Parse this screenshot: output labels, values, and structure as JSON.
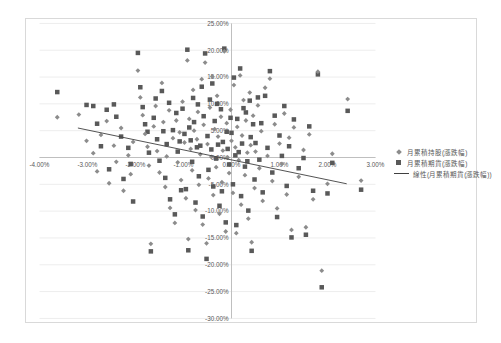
{
  "window": {
    "background": "#ffffff",
    "frame_border": "#d9d9d9"
  },
  "colors": {
    "gridline": "#ededed",
    "axis_line": "#bfbfbf",
    "tick_text": "#595959",
    "series1_marker": "#8c8c8c",
    "series2_marker": "#595959",
    "trendline": "#404040"
  },
  "chart_data": {
    "type": "scatter",
    "title": "",
    "xlabel": "",
    "ylabel": "",
    "grid": "horizontal-only",
    "legend_position": "right-middle",
    "x_axis": {
      "min": -4,
      "max": 3,
      "step": 1,
      "tick_values": [
        -4,
        -3,
        -2,
        -1,
        0,
        1,
        2,
        3
      ],
      "tick_labels": [
        "-4.00%",
        "-3.00%",
        "-2.00%",
        "-1.00%",
        "0.00%",
        "1.00%",
        "2.00%",
        "3.00%"
      ]
    },
    "y_axis": {
      "min": -30,
      "max": 25,
      "step": 5,
      "tick_values": [
        25,
        20,
        15,
        10,
        5,
        0,
        -5,
        -10,
        -15,
        -20,
        -25,
        -30
      ],
      "tick_labels": [
        "25.00%",
        "20.00%",
        "15.00%",
        "10.00%",
        "5.00%",
        "0.00%",
        "-5.00%",
        "-10.00%",
        "-15.00%",
        "-20.00%",
        "-25.00%",
        "-30.00%"
      ]
    },
    "series": [
      {
        "name": "月累積持股(漲跌幅)",
        "marker": "diamond",
        "color": "#8c8c8c",
        "points": [
          [
            -3.63,
            7.5
          ],
          [
            -3.18,
            8.0
          ],
          [
            -3.02,
            3.1
          ],
          [
            -2.88,
            0.8
          ],
          [
            -2.8,
            -2.6
          ],
          [
            -2.72,
            4.2
          ],
          [
            -2.6,
            6.8
          ],
          [
            -2.55,
            -4.8
          ],
          [
            -2.45,
            2.2
          ],
          [
            -2.4,
            -0.8
          ],
          [
            -2.3,
            5.5
          ],
          [
            -2.25,
            -6.2
          ],
          [
            -2.15,
            0.4
          ],
          [
            -2.1,
            -3.1
          ],
          [
            -2.05,
            2.9
          ],
          [
            -1.95,
            16.2
          ],
          [
            -1.9,
            11.2
          ],
          [
            -1.85,
            7.9
          ],
          [
            -1.8,
            4.4
          ],
          [
            -1.75,
            2.0
          ],
          [
            -1.72,
            -1.5
          ],
          [
            -1.68,
            -16.1
          ],
          [
            -1.62,
            5.8
          ],
          [
            -1.58,
            9.6
          ],
          [
            -1.55,
            1.2
          ],
          [
            -1.5,
            -2.8
          ],
          [
            -1.45,
            13.9
          ],
          [
            -1.42,
            6.6
          ],
          [
            -1.38,
            -5.5
          ],
          [
            -1.35,
            0.2
          ],
          [
            -1.3,
            8.8
          ],
          [
            -1.28,
            -9.4
          ],
          [
            -1.22,
            3.6
          ],
          [
            -1.18,
            -12.2
          ],
          [
            -1.15,
            6.9
          ],
          [
            -1.12,
            -0.9
          ],
          [
            -1.08,
            4.7
          ],
          [
            -1.05,
            -4.2
          ],
          [
            -1.02,
            10.4
          ],
          [
            -0.98,
            2.8
          ],
          [
            -0.95,
            -7.6
          ],
          [
            -0.92,
            18.1
          ],
          [
            -0.9,
            -15.2
          ],
          [
            -0.88,
            7.2
          ],
          [
            -0.85,
            1.6
          ],
          [
            -0.82,
            -2.4
          ],
          [
            -0.8,
            12.6
          ],
          [
            -0.78,
            5.0
          ],
          [
            -0.75,
            -9.8
          ],
          [
            -0.72,
            3.4
          ],
          [
            -0.7,
            8.5
          ],
          [
            -0.68,
            -5.1
          ],
          [
            -0.65,
            0.6
          ],
          [
            -0.62,
            14.6
          ],
          [
            -0.6,
            -12.5
          ],
          [
            -0.58,
            6.1
          ],
          [
            -0.55,
            17.7
          ],
          [
            -0.52,
            -16.0
          ],
          [
            -0.5,
            2.5
          ],
          [
            -0.48,
            -3.9
          ],
          [
            -0.45,
            9.3
          ],
          [
            -0.42,
            0.1
          ],
          [
            -0.4,
            15.1
          ],
          [
            -0.38,
            -7.0
          ],
          [
            -0.35,
            5.3
          ],
          [
            -0.32,
            -1.8
          ],
          [
            -0.3,
            11.5
          ],
          [
            -0.28,
            3.9
          ],
          [
            -0.25,
            -10.5
          ],
          [
            -0.22,
            7.6
          ],
          [
            -0.2,
            -4.6
          ],
          [
            -0.18,
            1.3
          ],
          [
            -0.15,
            19.8
          ],
          [
            -0.12,
            -13.8
          ],
          [
            -0.1,
            6.4
          ],
          [
            -0.08,
            0.0
          ],
          [
            -0.05,
            -2.9
          ],
          [
            -0.02,
            8.9
          ],
          [
            0.0,
            3.1
          ],
          [
            0.03,
            -6.6
          ],
          [
            0.05,
            13.5
          ],
          [
            0.08,
            1.9
          ],
          [
            0.1,
            -14.1
          ],
          [
            0.12,
            5.7
          ],
          [
            0.15,
            -0.5
          ],
          [
            0.18,
            15.3
          ],
          [
            0.2,
            -8.8
          ],
          [
            0.22,
            4.1
          ],
          [
            0.25,
            10.7
          ],
          [
            0.28,
            -3.3
          ],
          [
            0.3,
            6.9
          ],
          [
            0.33,
            0.9
          ],
          [
            0.35,
            -11.4
          ],
          [
            0.38,
            12.1
          ],
          [
            0.4,
            2.3
          ],
          [
            0.42,
            -15.8
          ],
          [
            0.45,
            7.8
          ],
          [
            0.48,
            -5.7
          ],
          [
            0.5,
            1.1
          ],
          [
            0.55,
            9.7
          ],
          [
            0.58,
            -2.0
          ],
          [
            0.62,
            4.9
          ],
          [
            0.65,
            -8.1
          ],
          [
            0.7,
            13.0
          ],
          [
            0.75,
            0.3
          ],
          [
            0.8,
            14.7
          ],
          [
            0.85,
            -4.4
          ],
          [
            0.9,
            6.2
          ],
          [
            0.95,
            -9.5
          ],
          [
            1.0,
            2.6
          ],
          [
            1.05,
            -1.2
          ],
          [
            1.1,
            8.2
          ],
          [
            1.15,
            -6.9
          ],
          [
            1.2,
            3.7
          ],
          [
            1.25,
            -13.5
          ],
          [
            1.3,
            5.6
          ],
          [
            1.4,
            -3.6
          ],
          [
            1.5,
            1.4
          ],
          [
            1.55,
            -13.0
          ],
          [
            1.62,
            4.3
          ],
          [
            1.7,
            -7.8
          ],
          [
            1.8,
            16.0
          ],
          [
            1.88,
            -21.1
          ],
          [
            2.0,
            -4.9
          ],
          [
            2.1,
            0.7
          ],
          [
            2.42,
            10.9
          ],
          [
            2.7,
            -4.3
          ]
        ]
      },
      {
        "name": "月累積期貨(漲跌幅)",
        "marker": "square",
        "color": "#595959",
        "points": [
          [
            -3.63,
            12.2
          ],
          [
            -3.02,
            9.8
          ],
          [
            -2.88,
            9.6
          ],
          [
            -2.8,
            6.3
          ],
          [
            -2.72,
            2.1
          ],
          [
            -2.6,
            8.9
          ],
          [
            -2.55,
            -2.2
          ],
          [
            -2.45,
            9.9
          ],
          [
            -2.4,
            7.6
          ],
          [
            -2.3,
            3.9
          ],
          [
            -2.25,
            -4.0
          ],
          [
            -2.15,
            1.8
          ],
          [
            -2.1,
            -1.2
          ],
          [
            -2.05,
            -8.2
          ],
          [
            -1.95,
            19.5
          ],
          [
            -1.9,
            13.1
          ],
          [
            -1.85,
            9.4
          ],
          [
            -1.8,
            6.2
          ],
          [
            -1.75,
            4.8
          ],
          [
            -1.72,
            0.9
          ],
          [
            -1.68,
            -17.5
          ],
          [
            -1.62,
            7.4
          ],
          [
            -1.58,
            11.0
          ],
          [
            -1.55,
            3.4
          ],
          [
            -1.5,
            -0.6
          ],
          [
            -1.45,
            12.4
          ],
          [
            -1.42,
            4.9
          ],
          [
            -1.38,
            -3.8
          ],
          [
            -1.35,
            2.5
          ],
          [
            -1.3,
            10.2
          ],
          [
            -1.28,
            -7.8
          ],
          [
            -1.22,
            5.1
          ],
          [
            -1.18,
            -10.6
          ],
          [
            -1.15,
            8.3
          ],
          [
            -1.12,
            1.1
          ],
          [
            -1.08,
            3.0
          ],
          [
            -1.05,
            -6.1
          ],
          [
            -1.02,
            9.1
          ],
          [
            -0.98,
            4.4
          ],
          [
            -0.95,
            -5.9
          ],
          [
            -0.92,
            20.1
          ],
          [
            -0.9,
            -17.3
          ],
          [
            -0.88,
            5.6
          ],
          [
            -0.85,
            3.2
          ],
          [
            -0.82,
            -0.8
          ],
          [
            -0.8,
            11.1
          ],
          [
            -0.78,
            6.6
          ],
          [
            -0.75,
            -8.4
          ],
          [
            -0.72,
            1.9
          ],
          [
            -0.7,
            9.9
          ],
          [
            -0.68,
            -3.5
          ],
          [
            -0.65,
            2.2
          ],
          [
            -0.62,
            13.2
          ],
          [
            -0.6,
            -11.0
          ],
          [
            -0.58,
            7.7
          ],
          [
            -0.55,
            19.4
          ],
          [
            -0.52,
            -18.9
          ],
          [
            -0.5,
            4.0
          ],
          [
            -0.48,
            -2.3
          ],
          [
            -0.45,
            10.8
          ],
          [
            -0.42,
            1.5
          ],
          [
            -0.4,
            13.8
          ],
          [
            -0.38,
            -5.4
          ],
          [
            -0.35,
            6.8
          ],
          [
            -0.32,
            -0.2
          ],
          [
            -0.3,
            10.0
          ],
          [
            -0.28,
            2.4
          ],
          [
            -0.25,
            -9.0
          ],
          [
            -0.22,
            9.0
          ],
          [
            -0.2,
            -6.3
          ],
          [
            -0.18,
            2.9
          ],
          [
            -0.15,
            20.3
          ],
          [
            -0.12,
            -12.1
          ],
          [
            -0.1,
            4.8
          ],
          [
            -0.08,
            1.6
          ],
          [
            -0.05,
            -1.3
          ],
          [
            -0.02,
            7.4
          ],
          [
            0.0,
            4.6
          ],
          [
            0.03,
            -5.0
          ],
          [
            0.05,
            14.9
          ],
          [
            0.08,
            0.4
          ],
          [
            0.1,
            -12.6
          ],
          [
            0.12,
            7.2
          ],
          [
            0.15,
            1.0
          ],
          [
            0.18,
            16.6
          ],
          [
            0.2,
            -7.2
          ],
          [
            0.22,
            2.6
          ],
          [
            0.25,
            9.2
          ],
          [
            0.28,
            -1.7
          ],
          [
            0.3,
            8.4
          ],
          [
            0.33,
            -0.7
          ],
          [
            0.35,
            -9.9
          ],
          [
            0.38,
            10.6
          ],
          [
            0.4,
            3.8
          ],
          [
            0.42,
            -17.4
          ],
          [
            0.45,
            6.2
          ],
          [
            0.48,
            -4.1
          ],
          [
            0.5,
            2.7
          ],
          [
            0.55,
            11.2
          ],
          [
            0.58,
            -0.4
          ],
          [
            0.62,
            6.4
          ],
          [
            0.65,
            -6.5
          ],
          [
            0.7,
            11.5
          ],
          [
            0.75,
            1.8
          ],
          [
            0.8,
            16.1
          ],
          [
            0.85,
            -2.8
          ],
          [
            0.9,
            7.8
          ],
          [
            0.95,
            -11.1
          ],
          [
            1.0,
            4.1
          ],
          [
            1.05,
            0.3
          ],
          [
            1.1,
            9.6
          ],
          [
            1.15,
            -5.3
          ],
          [
            1.2,
            2.1
          ],
          [
            1.25,
            -14.9
          ],
          [
            1.3,
            7.1
          ],
          [
            1.4,
            -2.0
          ],
          [
            1.5,
            -0.1
          ],
          [
            1.55,
            -14.4
          ],
          [
            1.62,
            5.8
          ],
          [
            1.7,
            -6.2
          ],
          [
            1.8,
            15.5
          ],
          [
            1.88,
            -24.2
          ],
          [
            2.0,
            -6.7
          ],
          [
            2.1,
            -1.0
          ],
          [
            2.42,
            8.7
          ],
          [
            2.7,
            -6.0
          ]
        ]
      }
    ],
    "trendline": {
      "name": "線性(月累積期貨(漲跌幅))",
      "color": "#404040",
      "x1": -3.2,
      "y1": 5.5,
      "x2": 2.4,
      "y2": -4.9
    }
  }
}
